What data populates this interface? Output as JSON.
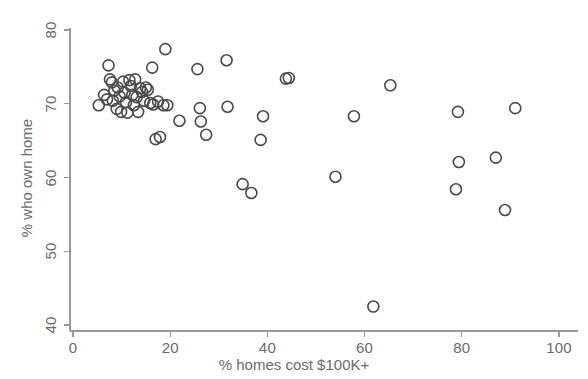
{
  "chart_data": {
    "type": "scatter",
    "title": "",
    "xlabel": "% homes cost $100K+",
    "ylabel": "% who own home",
    "xlim": [
      0,
      100
    ],
    "ylim": [
      40,
      80
    ],
    "xticks": [
      0,
      20,
      40,
      60,
      80,
      100
    ],
    "yticks": [
      40,
      50,
      60,
      70,
      80
    ],
    "xtick_labels": [
      "0",
      "20",
      "40",
      "60",
      "80",
      "100"
    ],
    "ytick_labels": [
      "40",
      "50",
      "60",
      "70",
      "80"
    ],
    "grid": false,
    "legend": null,
    "marker": {
      "shape": "circle",
      "filled": false,
      "edge_color": "#4a4a4a",
      "face_color": "none",
      "size_px": 11,
      "stroke_px": 1.6
    },
    "axis_color": "#9a9a9a",
    "points": [
      {
        "x": 5.3,
        "y": 69.8
      },
      {
        "x": 6.4,
        "y": 71.2
      },
      {
        "x": 7.0,
        "y": 70.6
      },
      {
        "x": 7.3,
        "y": 75.2
      },
      {
        "x": 7.6,
        "y": 73.3
      },
      {
        "x": 8.0,
        "y": 72.9
      },
      {
        "x": 8.2,
        "y": 70.4
      },
      {
        "x": 8.5,
        "y": 71.8
      },
      {
        "x": 9.0,
        "y": 69.3
      },
      {
        "x": 9.2,
        "y": 72.2
      },
      {
        "x": 9.6,
        "y": 71.0
      },
      {
        "x": 9.9,
        "y": 68.9
      },
      {
        "x": 10.3,
        "y": 73.0
      },
      {
        "x": 10.6,
        "y": 71.5
      },
      {
        "x": 10.9,
        "y": 70.2
      },
      {
        "x": 11.2,
        "y": 68.8
      },
      {
        "x": 11.6,
        "y": 73.2
      },
      {
        "x": 11.9,
        "y": 72.4
      },
      {
        "x": 12.2,
        "y": 71.2
      },
      {
        "x": 12.5,
        "y": 69.8
      },
      {
        "x": 12.8,
        "y": 73.3
      },
      {
        "x": 13.1,
        "y": 70.9
      },
      {
        "x": 13.4,
        "y": 68.9
      },
      {
        "x": 13.8,
        "y": 72.1
      },
      {
        "x": 14.2,
        "y": 71.6
      },
      {
        "x": 14.6,
        "y": 70.4
      },
      {
        "x": 15.0,
        "y": 72.2
      },
      {
        "x": 15.4,
        "y": 71.9
      },
      {
        "x": 15.9,
        "y": 70.1
      },
      {
        "x": 16.3,
        "y": 74.9
      },
      {
        "x": 16.5,
        "y": 69.9
      },
      {
        "x": 17.0,
        "y": 65.2
      },
      {
        "x": 17.5,
        "y": 70.3
      },
      {
        "x": 17.9,
        "y": 65.5
      },
      {
        "x": 18.6,
        "y": 69.8
      },
      {
        "x": 19.0,
        "y": 77.4
      },
      {
        "x": 19.4,
        "y": 69.8
      },
      {
        "x": 21.9,
        "y": 67.7
      },
      {
        "x": 25.6,
        "y": 74.7
      },
      {
        "x": 26.1,
        "y": 69.4
      },
      {
        "x": 26.3,
        "y": 67.6
      },
      {
        "x": 27.4,
        "y": 65.8
      },
      {
        "x": 31.6,
        "y": 75.9
      },
      {
        "x": 31.8,
        "y": 69.6
      },
      {
        "x": 34.9,
        "y": 59.1
      },
      {
        "x": 36.7,
        "y": 57.9
      },
      {
        "x": 38.6,
        "y": 65.1
      },
      {
        "x": 39.1,
        "y": 68.3
      },
      {
        "x": 43.8,
        "y": 73.4
      },
      {
        "x": 44.4,
        "y": 73.5
      },
      {
        "x": 54.0,
        "y": 60.1
      },
      {
        "x": 57.8,
        "y": 68.3
      },
      {
        "x": 61.8,
        "y": 42.5
      },
      {
        "x": 65.3,
        "y": 72.5
      },
      {
        "x": 78.8,
        "y": 58.4
      },
      {
        "x": 79.2,
        "y": 68.9
      },
      {
        "x": 79.4,
        "y": 62.1
      },
      {
        "x": 87.0,
        "y": 62.7
      },
      {
        "x": 88.9,
        "y": 55.6
      },
      {
        "x": 91.0,
        "y": 69.4
      }
    ]
  }
}
